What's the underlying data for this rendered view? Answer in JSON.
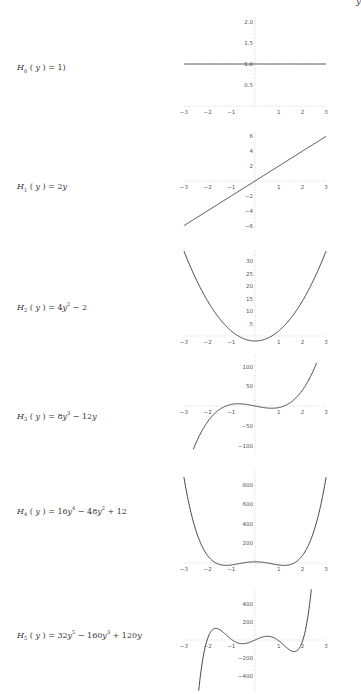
{
  "corner_text": "y",
  "chart_data": [
    {
      "type": "line",
      "title": "",
      "label": {
        "name": "H",
        "sub": "0",
        "expr": "(y) = 1"
      },
      "label_html": "<i>H</i><sub>0</sub><span class='up'> ( </span><i>y</i><span class='up'> ) = 1)</span>",
      "coefficients": [
        1
      ],
      "xlim": [
        -3,
        3
      ],
      "ylim": [
        0,
        2
      ],
      "x_ticks": [
        -3,
        -2,
        -1,
        1,
        2,
        3
      ],
      "y_ticks": [
        {
          "v": 0.5,
          "t": "0.5"
        },
        {
          "v": 1.0,
          "t": "1.0"
        },
        {
          "v": 1.5,
          "t": "1.5"
        },
        {
          "v": 2.0,
          "t": "2.0"
        }
      ],
      "x": [
        -3,
        -2,
        -1,
        0,
        1,
        2,
        3
      ],
      "values": [
        1,
        1,
        1,
        1,
        1,
        1,
        1
      ],
      "frame": {
        "label_x": 17,
        "label_y": 63,
        "x0": 255,
        "xscale": 23.7,
        "y0": 106,
        "yscale": 42,
        "ytop": 18,
        "ybot": 108,
        "xmin": -3,
        "xmax": 3
      }
    },
    {
      "type": "line",
      "title": "",
      "label": {
        "name": "H",
        "sub": "1",
        "expr": "(y) = 2y"
      },
      "label_html": "<i>H</i><sub>1</sub><span class='up'> ( </span><i>y</i><span class='up'> ) = 2</span><i>y</i>",
      "coefficients": [
        0,
        2
      ],
      "xlim": [
        -3,
        3
      ],
      "ylim": [
        -6,
        6
      ],
      "x_ticks": [
        -3,
        -2,
        -1,
        1,
        2,
        3
      ],
      "y_ticks": [
        {
          "v": -6,
          "t": "-6"
        },
        {
          "v": -4,
          "t": "-4"
        },
        {
          "v": -2,
          "t": "-2"
        },
        {
          "v": 2,
          "t": "2"
        },
        {
          "v": 4,
          "t": "4"
        },
        {
          "v": 6,
          "t": "6"
        }
      ],
      "x": [
        -3,
        -2,
        -1,
        0,
        1,
        2,
        3
      ],
      "values": [
        -6,
        -4,
        -2,
        0,
        2,
        4,
        6
      ],
      "frame": {
        "label_x": 17,
        "label_y": 182,
        "x0": 255,
        "xscale": 23.7,
        "y0": 181,
        "yscale": 7.45,
        "ytop": 132,
        "ybot": 230,
        "xmin": -3,
        "xmax": 3
      }
    },
    {
      "type": "line",
      "title": "",
      "label": {
        "name": "H",
        "sub": "2",
        "expr": "(y) = 4y^2 - 2"
      },
      "label_html": "<i>H</i><sub>2</sub><span class='up'> ( </span><i>y</i><span class='up'> ) = 4</span><i>y</i><sup>2</sup><span class='up'> − 2</span>",
      "coefficients": [
        -2,
        0,
        4
      ],
      "xlim": [
        -3,
        3
      ],
      "ylim": [
        -2,
        34
      ],
      "x_ticks": [
        -3,
        -2,
        -1,
        1,
        2,
        3
      ],
      "y_ticks": [
        {
          "v": 5,
          "t": "5"
        },
        {
          "v": 10,
          "t": "10"
        },
        {
          "v": 15,
          "t": "15"
        },
        {
          "v": 20,
          "t": "20"
        },
        {
          "v": 25,
          "t": "25"
        },
        {
          "v": 30,
          "t": "30"
        }
      ],
      "x": [
        -3,
        -2,
        -1,
        0,
        1,
        2,
        3
      ],
      "values": [
        34,
        14,
        2,
        -2,
        2,
        14,
        34
      ],
      "frame": {
        "label_x": 17,
        "label_y": 301,
        "x0": 255,
        "xscale": 23.7,
        "y0": 336,
        "yscale": 2.5,
        "ytop": 250,
        "ybot": 342,
        "xmin": -3,
        "xmax": 3
      }
    },
    {
      "type": "line",
      "title": "",
      "label": {
        "name": "H",
        "sub": "3",
        "expr": "(y) = 8y^3 - 12y"
      },
      "label_html": "<i>H</i><sub>3</sub><span class='up'> ( </span><i>y</i><span class='up'> ) = 8</span><i>y</i><sup>3</sup><span class='up'> − 12</span><i>y</i>",
      "coefficients": [
        0,
        -12,
        0,
        8
      ],
      "xlim": [
        -3,
        3
      ],
      "ylim": [
        -120,
        110
      ],
      "x_ticks": [
        -3,
        -2,
        -1,
        1,
        2,
        3
      ],
      "y_ticks": [
        {
          "v": -100,
          "t": "-100"
        },
        {
          "v": -50,
          "t": "-50"
        },
        {
          "v": 50,
          "t": "50"
        },
        {
          "v": 100,
          "t": "100"
        }
      ],
      "x": [
        -2.6,
        -2,
        -1,
        0,
        1,
        2,
        2.6
      ],
      "values": [
        -109.4,
        -40,
        4,
        0,
        -4,
        40,
        109.4
      ],
      "frame": {
        "label_x": 17,
        "label_y": 410,
        "x0": 255,
        "xscale": 23.7,
        "y0": 406,
        "yscale": 0.395,
        "ytop": 355,
        "ybot": 455,
        "xmin": -2.6,
        "xmax": 2.6
      }
    },
    {
      "type": "line",
      "title": "",
      "label": {
        "name": "H",
        "sub": "4",
        "expr": "(y) = 16y^4 - 48y^2 + 12"
      },
      "label_html": "<i>H</i><sub>4</sub><span class='up'> ( </span><i>y</i><span class='up'> ) = 16</span><i>y</i><sup>4</sup><span class='up'> − 48</span><i>y</i><sup>2</sup><span class='up'> + 12</span>",
      "coefficients": [
        12,
        0,
        -48,
        0,
        16
      ],
      "xlim": [
        -3,
        3
      ],
      "ylim": [
        -20,
        876
      ],
      "x_ticks": [
        -3,
        -2,
        -1,
        1,
        2,
        3
      ],
      "y_ticks": [
        {
          "v": 200,
          "t": "200"
        },
        {
          "v": 400,
          "t": "400"
        },
        {
          "v": 600,
          "t": "600"
        },
        {
          "v": 800,
          "t": "800"
        }
      ],
      "x": [
        -3,
        -2,
        -1,
        0,
        1,
        2,
        3
      ],
      "values": [
        876,
        76,
        -20,
        12,
        -20,
        76,
        876
      ],
      "frame": {
        "label_x": 17,
        "label_y": 505,
        "x0": 255,
        "xscale": 23.7,
        "y0": 563,
        "yscale": 0.098,
        "ytop": 470,
        "ybot": 568,
        "xmin": -3,
        "xmax": 3
      }
    },
    {
      "type": "line",
      "title": "",
      "label": {
        "name": "H",
        "sub": "5",
        "expr": "(y) = 32y^5 - 160y^3 + 120y"
      },
      "label_html": "<i>H</i><sub>5</sub><span class='up'> ( </span><i>y</i><span class='up'> ) = 32</span><i>y</i><sup>5</sup><span class='up'> − 160</span><i>y</i><sup>3</sup><span class='up'> + 120</span><i>y</i>",
      "coefficients": [
        0,
        120,
        0,
        -160,
        0,
        32
      ],
      "xlim": [
        -3,
        3
      ],
      "ylim": [
        -480,
        480
      ],
      "x_ticks": [
        -3,
        -2,
        -1,
        1,
        2,
        3
      ],
      "y_ticks": [
        {
          "v": -400,
          "t": "-400"
        },
        {
          "v": -200,
          "t": "-200"
        },
        {
          "v": 200,
          "t": "200"
        },
        {
          "v": 400,
          "t": "400"
        }
      ],
      "x": [
        -2.38,
        -2,
        -1.5,
        -1,
        0,
        1,
        1.5,
        2,
        2.38
      ],
      "values": [
        -470,
        -16,
        141,
        -8,
        0,
        8,
        -141,
        16,
        470
      ],
      "frame": {
        "label_x": 17,
        "label_y": 629,
        "x0": 255,
        "xscale": 23.7,
        "y0": 640,
        "yscale": 0.09,
        "ytop": 590,
        "ybot": 692,
        "xmin": -2.45,
        "xmax": 2.45
      }
    }
  ],
  "style": {
    "curve_color": "#333333",
    "axis_color": "#bbbbbb",
    "tick_color": "#cccccc"
  }
}
